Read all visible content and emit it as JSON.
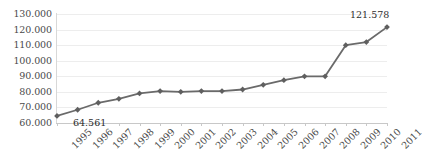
{
  "chart_data": {
    "type": "line",
    "title": "",
    "subtitle": "",
    "xlabel": "",
    "ylabel": "",
    "categories": [
      "1995",
      "1996",
      "1997",
      "1998",
      "1999",
      "2000",
      "2001",
      "2002",
      "2003",
      "2004",
      "2005",
      "2006",
      "2007",
      "2008",
      "2009",
      "2010",
      "2011"
    ],
    "values": [
      64561,
      68500,
      73000,
      75500,
      79000,
      80500,
      80000,
      80500,
      80500,
      81500,
      84500,
      87500,
      90000,
      90000,
      110000,
      112000,
      121578
    ],
    "series": [
      {
        "name": "series-1",
        "values": [
          64561,
          68500,
          73000,
          75500,
          79000,
          80500,
          80000,
          80500,
          80500,
          81500,
          84500,
          87500,
          90000,
          90000,
          110000,
          112000,
          121578
        ]
      }
    ],
    "ylim": [
      60000,
      130000
    ],
    "ytick_labels": [
      "130.000",
      "120.000",
      "110.000",
      "100.000",
      "90.000",
      "80.000",
      "70.000",
      "60.000"
    ],
    "ytick_values": [
      130000,
      120000,
      110000,
      100000,
      90000,
      80000,
      70000,
      60000
    ],
    "grid": true,
    "legend": false,
    "legend_position": "none",
    "annotations": [
      {
        "name": "first-point-label",
        "text": "64.561",
        "category": "1995",
        "value": 64561
      },
      {
        "name": "last-point-label",
        "text": "121.578",
        "category": "2011",
        "value": 121578
      }
    ],
    "colors": {
      "line": "#6a6a6a",
      "marker": "#5f5f5f",
      "grid": "#ededed",
      "axis": "#c8c8c8",
      "background": "#ffffff",
      "text": "#4a4a4a"
    }
  }
}
